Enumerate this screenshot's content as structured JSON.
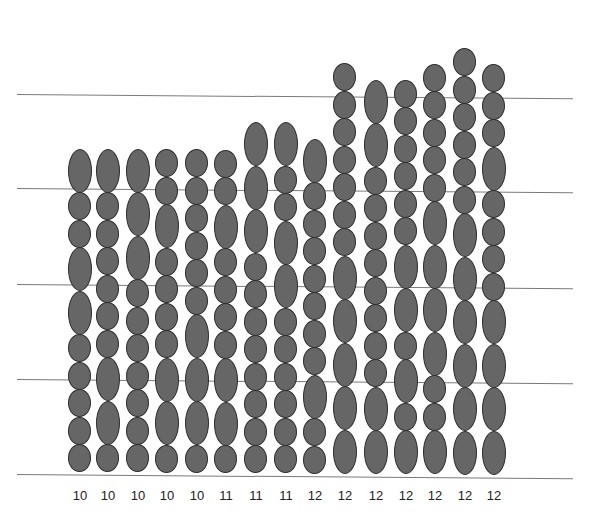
{
  "figure": {
    "type": "stacked-oval-columns",
    "guide_lines_y": [
      94,
      188,
      284,
      379,
      474
    ],
    "line_x_start": 17,
    "line_x_end": 573,
    "baseline_y": 472,
    "unit_pitch": {
      "S": 29,
      "L": 45
    },
    "colors": {
      "fill": "#666666",
      "stroke": "#2e2e2e",
      "line": "#7a7a7a",
      "text": "#222222"
    }
  },
  "columns": [
    {
      "x": 80,
      "label": "10",
      "ovals": [
        "L",
        "S",
        "S",
        "L",
        "L",
        "S",
        "S",
        "S",
        "S",
        "S"
      ]
    },
    {
      "x": 108,
      "label": "10",
      "ovals": [
        "L",
        "S",
        "S",
        "S",
        "S",
        "S",
        "S",
        "L",
        "L",
        "S"
      ]
    },
    {
      "x": 138,
      "label": "10",
      "ovals": [
        "L",
        "L",
        "L",
        "S",
        "S",
        "S",
        "S",
        "S",
        "S",
        "S"
      ]
    },
    {
      "x": 167,
      "label": "10",
      "ovals": [
        "S",
        "S",
        "L",
        "S",
        "S",
        "S",
        "S",
        "L",
        "L",
        "S"
      ]
    },
    {
      "x": 197,
      "label": "10",
      "ovals": [
        "S",
        "S",
        "S",
        "S",
        "S",
        "S",
        "L",
        "L",
        "L",
        "S"
      ]
    },
    {
      "x": 226,
      "label": "11",
      "ovals": [
        "S",
        "S",
        "L",
        "S",
        "S",
        "S",
        "S",
        "L",
        "L",
        "S"
      ]
    },
    {
      "x": 256,
      "label": "11",
      "ovals": [
        "L",
        "L",
        "L",
        "S",
        "S",
        "S",
        "S",
        "S",
        "S",
        "S",
        "S"
      ]
    },
    {
      "x": 286,
      "label": "11",
      "ovals": [
        "L",
        "S",
        "S",
        "L",
        "L",
        "S",
        "S",
        "S",
        "S",
        "S",
        "S"
      ]
    },
    {
      "x": 315,
      "label": "12",
      "ovals": [
        "L",
        "S",
        "S",
        "S",
        "S",
        "S",
        "S",
        "S",
        "L",
        "S",
        "S"
      ]
    },
    {
      "x": 345,
      "label": "12",
      "ovals": [
        "S",
        "S",
        "S",
        "S",
        "S",
        "S",
        "S",
        "L",
        "L",
        "L",
        "L",
        "L"
      ]
    },
    {
      "x": 376,
      "label": "12",
      "ovals": [
        "L",
        "L",
        "S",
        "S",
        "S",
        "S",
        "S",
        "S",
        "S",
        "S",
        "L",
        "L"
      ]
    },
    {
      "x": 406,
      "label": "12",
      "ovals": [
        "S",
        "S",
        "S",
        "S",
        "S",
        "S",
        "L",
        "L",
        "S",
        "L",
        "S",
        "L"
      ]
    },
    {
      "x": 435,
      "label": "12",
      "ovals": [
        "S",
        "S",
        "S",
        "S",
        "S",
        "L",
        "L",
        "L",
        "L",
        "S",
        "S",
        "L"
      ]
    },
    {
      "x": 465,
      "label": "12",
      "ovals": [
        "S",
        "S",
        "S",
        "S",
        "S",
        "S",
        "L",
        "L",
        "L",
        "L",
        "L",
        "L"
      ]
    },
    {
      "x": 494,
      "label": "12",
      "ovals": [
        "S",
        "S",
        "S",
        "L",
        "S",
        "S",
        "S",
        "S",
        "L",
        "L",
        "L",
        "L"
      ]
    }
  ],
  "labels": [
    "10",
    "10",
    "10",
    "10",
    "10",
    "11",
    "11",
    "11",
    "12",
    "12",
    "12",
    "12",
    "12",
    "12",
    "12"
  ]
}
